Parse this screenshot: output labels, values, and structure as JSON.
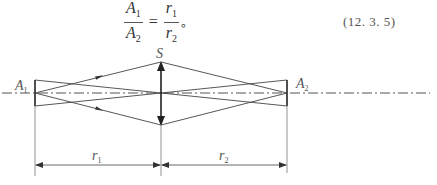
{
  "formula": {
    "lhs": {
      "num": "A",
      "num_sub": "1",
      "den": "A",
      "den_sub": "2"
    },
    "equals": "=",
    "rhs": {
      "num": "r",
      "num_sub": "1",
      "den": "r",
      "den_sub": "2"
    },
    "terminator": "。",
    "number": "(12. 3. 5)"
  },
  "diagram": {
    "labels": {
      "source_left": "A",
      "source_left_sub": "1",
      "source_right": "A",
      "source_right_sub": "2",
      "lens": "S",
      "distance_left": "r",
      "distance_left_sub": "1",
      "distance_right": "r",
      "distance_right_sub": "2"
    },
    "colors": {
      "line": "#444444",
      "axis": "#555555"
    }
  }
}
